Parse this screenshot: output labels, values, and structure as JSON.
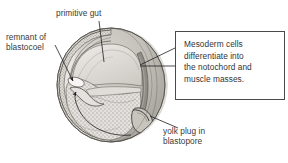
{
  "figure": {
    "name": "amphibian-gastrula-cross-section",
    "background_color": "#ffffff",
    "text_color": "#3a3a3a",
    "box_border_color": "#4a4a4a",
    "ink_color": "#2b2b2b"
  },
  "labels": {
    "primitive_gut": "primitive gut",
    "remnant_of_blastocoel": "remnant of\nblastocoel",
    "yolk_plug_in_blastopore": "yolk plug in\nblastopore"
  },
  "callout": {
    "text": "Mesoderm cells\ndifferentiate into\nthe notochord and\nmuscle masses."
  },
  "structures": [
    "ectoderm-rim",
    "archenteron-cavity",
    "yolk-mass",
    "yolk-plug",
    "blastopore",
    "blastocoel-remnant",
    "mesoderm-band",
    "sphere-outer-surface"
  ]
}
